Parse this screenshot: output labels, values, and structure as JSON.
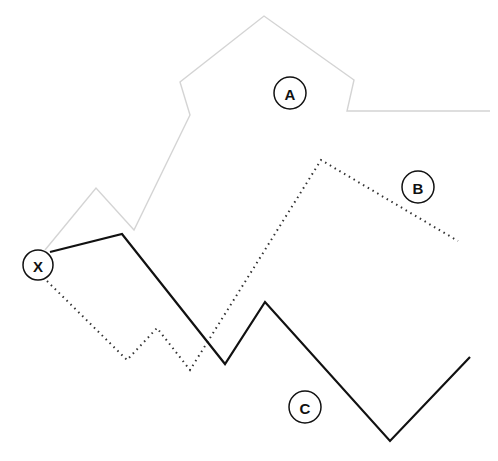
{
  "diagram": {
    "origin": {
      "label": "X",
      "cx": 38,
      "cy": 265,
      "r": 15
    },
    "paths": [
      {
        "id": "A",
        "label": "A",
        "style": "solid-light",
        "color": "#d4d4d4",
        "points": "45,250 96,188 134,230 190,115 180,82 264,16 354,80 347,111 490,111",
        "label_pos": {
          "cx": 290,
          "cy": 93,
          "r": 16
        }
      },
      {
        "id": "B",
        "label": "B",
        "style": "dotted",
        "color": "#333333",
        "points": "47,281 127,360 157,328 190,370 321,160 458,241",
        "label_pos": {
          "cx": 418,
          "cy": 187,
          "r": 16
        }
      },
      {
        "id": "C",
        "label": "C",
        "style": "solid-dark",
        "color": "#111111",
        "points": "50,252 122,234 225,364 265,302 390,441 470,357",
        "label_pos": {
          "cx": 305,
          "cy": 407,
          "r": 16
        }
      }
    ]
  }
}
